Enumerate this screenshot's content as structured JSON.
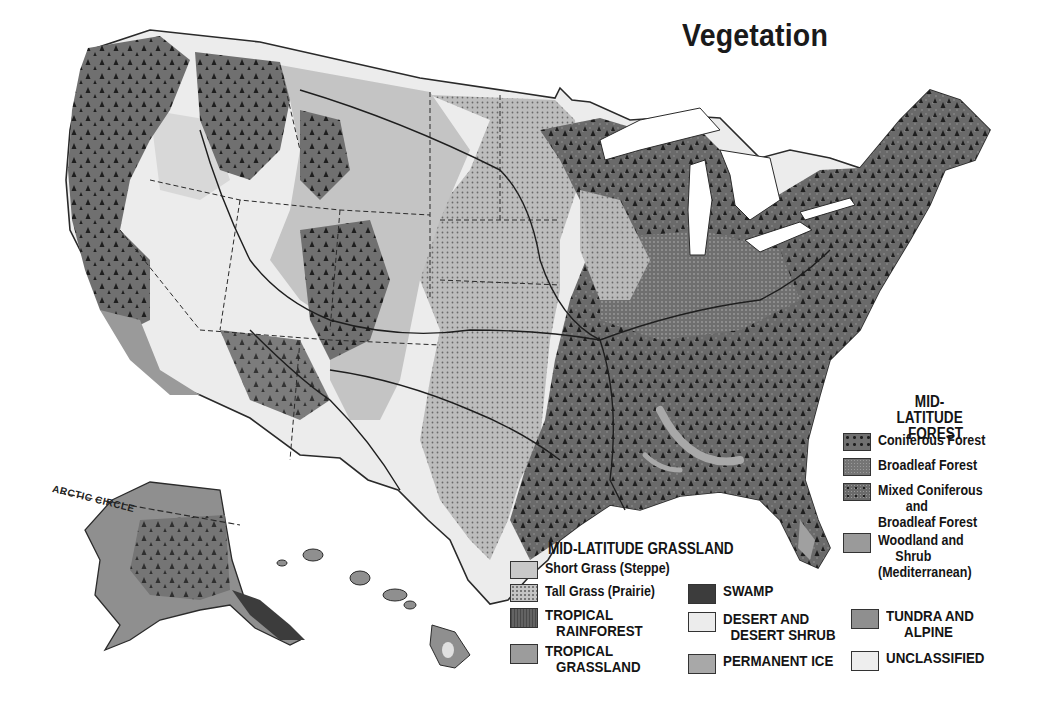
{
  "map": {
    "title": "Vegetation",
    "arctic_label": "ARCTIC CIRCLE",
    "colors": {
      "background": "#ffffff",
      "coniferous_forest": "#6e6e6e",
      "broadleaf_forest": "#757575",
      "mixed_forest": "#6a6a6a",
      "woodland_shrub": "#9a9a9a",
      "short_grass": "#c4c4c4",
      "tall_grass": "#b9b9b9",
      "tropical_rainforest": "#5c5c5c",
      "tropical_grassland": "#9c9c9c",
      "swamp": "#3c3c3c",
      "desert_shrub": "#ececec",
      "permanent_ice": "#a8a8a8",
      "tundra_alpine": "#8f8f8f",
      "unclassified": "#eeeeee",
      "water": "#ffffff",
      "border": "#2a2a2a"
    }
  },
  "legend": {
    "forest": {
      "heading_line1": "MID-LATITUDE",
      "heading_line2": "FOREST",
      "items": [
        {
          "label": "Coniferous Forest",
          "icon": "coniferous-pattern"
        },
        {
          "label": "Broadleaf Forest",
          "icon": "broadleaf-pattern"
        },
        {
          "label": "Mixed Coniferous\n        and\nBroadleaf Forest",
          "icon": "mixed-pattern"
        },
        {
          "label": "Woodland and\n     Shrub\n(Mediterranean)",
          "icon": "woodland-swatch"
        }
      ]
    },
    "grassland": {
      "heading": "MID-LATITUDE GRASSLAND",
      "items": [
        {
          "label": "Short Grass (Steppe)",
          "icon": "short-grass-swatch"
        },
        {
          "label": "Tall Grass (Prairie)",
          "icon": "tall-grass-pattern"
        }
      ]
    },
    "other": [
      {
        "label": "TROPICAL\n   RAINFOREST",
        "icon": "rainforest-pattern"
      },
      {
        "label": "TROPICAL\n   GRASSLAND",
        "icon": "tropical-grassland-swatch"
      },
      {
        "label": "SWAMP",
        "icon": "swamp-swatch"
      },
      {
        "label": "DESERT AND\n  DESERT SHRUB",
        "icon": "desert-swatch"
      },
      {
        "label": "PERMANENT ICE",
        "icon": "ice-swatch"
      },
      {
        "label": "TUNDRA AND\n     ALPINE",
        "icon": "tundra-swatch"
      },
      {
        "label": "UNCLASSIFIED",
        "icon": "unclassified-swatch"
      }
    ]
  }
}
